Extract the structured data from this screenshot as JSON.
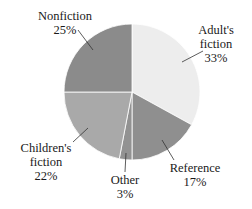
{
  "chart_data": {
    "type": "pie",
    "title": "",
    "slices": [
      {
        "name": "Adult's fiction",
        "label_lines": [
          "Adult's",
          "fiction"
        ],
        "value": 33,
        "display": "33%",
        "color": "#ededed"
      },
      {
        "name": "Reference",
        "label_lines": [
          "Reference"
        ],
        "value": 17,
        "display": "17%",
        "color": "#8f8f8f"
      },
      {
        "name": "Other",
        "label_lines": [
          "Other"
        ],
        "value": 3,
        "display": "3%",
        "color": "#929292"
      },
      {
        "name": "Children's fiction",
        "label_lines": [
          "Children's",
          "fiction"
        ],
        "value": 22,
        "display": "22%",
        "color": "#a9a9a9"
      },
      {
        "name": "Nonfiction",
        "label_lines": [
          "Nonfiction"
        ],
        "value": 25,
        "display": "25%",
        "color": "#8b8b8b"
      }
    ],
    "categories": [
      "Adult's fiction",
      "Reference",
      "Other",
      "Children's fiction",
      "Nonfiction"
    ],
    "values": [
      33,
      17,
      3,
      22,
      25
    ],
    "units": "%",
    "start_angle_deg": 0,
    "direction": "clockwise",
    "legend": "none (direct labels with leader lines)"
  },
  "labels": {
    "adult": {
      "line1": "Adult's",
      "line2": "fiction",
      "pct": "33%"
    },
    "reference": {
      "line1": "Reference",
      "pct": "17%"
    },
    "other": {
      "line1": "Other",
      "pct": "3%"
    },
    "children": {
      "line1": "Children's",
      "line2": "fiction",
      "pct": "22%"
    },
    "nonfiction": {
      "line1": "Nonfiction",
      "pct": "25%"
    }
  }
}
